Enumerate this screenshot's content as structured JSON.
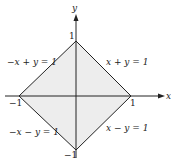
{
  "diagram": {
    "axes": {
      "x_label": "x",
      "y_label": "y"
    },
    "ticks": {
      "x_pos": "1",
      "x_neg": "−1",
      "y_pos": "1",
      "y_neg": "−1"
    },
    "edges": [
      {
        "id": "top-right",
        "equation": "x + y = 1"
      },
      {
        "id": "top-left",
        "equation": "−x + y = 1"
      },
      {
        "id": "bottom-left",
        "equation": "−x − y = 1"
      },
      {
        "id": "bottom-right",
        "equation": "x − y = 1"
      }
    ],
    "region": "|x| + |y| ≤ 1",
    "colors": {
      "line": "#222222",
      "fill": "#d8d8d8"
    }
  }
}
